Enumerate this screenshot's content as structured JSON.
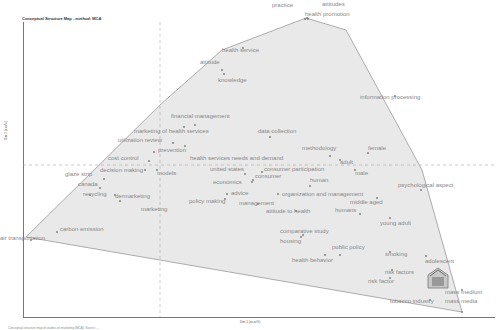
{
  "chart_data": {
    "type": "scatter",
    "title": "Conceptual Structure Map - method: MCA",
    "xlabel": "Dim 1 (xx.xx%)",
    "ylabel": "Dim 2 (x.xx%)",
    "grid": false,
    "reference_lines": {
      "x_zero": 160,
      "y_zero": 165
    },
    "hull_color": "#e8e8e8",
    "hull_stroke": "#999999",
    "hull": [
      [
        26,
        237
      ],
      [
        160,
        105
      ],
      [
        222,
        50
      ],
      [
        306,
        18
      ],
      [
        346,
        30
      ],
      [
        422,
        170
      ],
      [
        462,
        312
      ],
      [
        26,
        237
      ]
    ],
    "points": [
      {
        "label": "practice",
        "x": 305,
        "y": 19,
        "lx": 272,
        "ly": 7
      },
      {
        "label": "attitudes",
        "x": 307,
        "y": 18,
        "lx": 322,
        "ly": 6
      },
      {
        "label": "health promotion",
        "x": 308,
        "y": 19,
        "lx": 305,
        "ly": 16
      },
      {
        "label": "health service",
        "x": 243,
        "y": 48,
        "lx": 222,
        "ly": 52
      },
      {
        "label": "attitude",
        "x": 222,
        "y": 70,
        "lx": 200,
        "ly": 64
      },
      {
        "label": "knowledge",
        "x": 224,
        "y": 74,
        "lx": 218,
        "ly": 82
      },
      {
        "label": "information processing",
        "x": 395,
        "y": 96,
        "lx": 360,
        "ly": 99
      },
      {
        "label": "financial management",
        "x": 195,
        "y": 125,
        "lx": 171,
        "ly": 118
      },
      {
        "label": "marketing of health services",
        "x": 184,
        "y": 127,
        "lx": 134,
        "ly": 133
      },
      {
        "label": "data collection",
        "x": 270,
        "y": 137,
        "lx": 258,
        "ly": 133
      },
      {
        "label": "utilization review",
        "x": 173,
        "y": 143,
        "lx": 118,
        "ly": 142
      },
      {
        "label": "prevention",
        "x": 154,
        "y": 152,
        "lx": 158,
        "ly": 152
      },
      {
        "label": "health services needs and demand",
        "x": 185,
        "y": 146,
        "lx": 190,
        "ly": 160
      },
      {
        "label": "methodology",
        "x": 330,
        "y": 156,
        "lx": 302,
        "ly": 150
      },
      {
        "label": "female",
        "x": 368,
        "y": 153,
        "lx": 368,
        "ly": 150
      },
      {
        "label": "adult",
        "x": 340,
        "y": 160,
        "lx": 340,
        "ly": 164
      },
      {
        "label": "male",
        "x": 355,
        "y": 170,
        "lx": 355,
        "ly": 175
      },
      {
        "label": "cost control",
        "x": 149,
        "y": 161,
        "lx": 108,
        "ly": 160
      },
      {
        "label": "decision making",
        "x": 145,
        "y": 170,
        "lx": 100,
        "ly": 172
      },
      {
        "label": "models",
        "x": 157,
        "y": 170,
        "lx": 157,
        "ly": 175
      },
      {
        "label": "united states",
        "x": 245,
        "y": 174,
        "lx": 210,
        "ly": 171
      },
      {
        "label": "consumer participation",
        "x": 262,
        "y": 172,
        "lx": 264,
        "ly": 171
      },
      {
        "label": "consumer",
        "x": 253,
        "y": 180,
        "lx": 255,
        "ly": 178
      },
      {
        "label": "economics",
        "x": 252,
        "y": 182,
        "lx": 213,
        "ly": 184
      },
      {
        "label": "human",
        "x": 310,
        "y": 186,
        "lx": 310,
        "ly": 182
      },
      {
        "label": "glaze strip",
        "x": 104,
        "y": 179,
        "lx": 65,
        "ly": 176
      },
      {
        "label": "canada",
        "x": 100,
        "y": 188,
        "lx": 78,
        "ly": 186
      },
      {
        "label": "psychological aspect",
        "x": 421,
        "y": 190,
        "lx": 398,
        "ly": 187
      },
      {
        "label": "advice",
        "x": 227,
        "y": 194,
        "lx": 231,
        "ly": 195
      },
      {
        "label": "organization and management",
        "x": 278,
        "y": 194,
        "lx": 282,
        "ly": 196
      },
      {
        "label": "recycling",
        "x": 90,
        "y": 195,
        "lx": 83,
        "ly": 196
      },
      {
        "label": "dermarketing",
        "x": 115,
        "y": 195,
        "lx": 115,
        "ly": 198
      },
      {
        "label": "middle aged",
        "x": 377,
        "y": 198,
        "lx": 350,
        "ly": 204
      },
      {
        "label": "policy making",
        "x": 225,
        "y": 199,
        "lx": 189,
        "ly": 203
      },
      {
        "label": "management",
        "x": 258,
        "y": 204,
        "lx": 239,
        "ly": 205
      },
      {
        "label": "marketing",
        "x": 120,
        "y": 201,
        "lx": 141,
        "ly": 211
      },
      {
        "label": "attitude to health",
        "x": 296,
        "y": 211,
        "lx": 266,
        "ly": 213
      },
      {
        "label": "humans",
        "x": 360,
        "y": 214,
        "lx": 335,
        "ly": 212
      },
      {
        "label": "young adult",
        "x": 390,
        "y": 218,
        "lx": 380,
        "ly": 225
      },
      {
        "label": "comparative study",
        "x": 303,
        "y": 235,
        "lx": 280,
        "ly": 233
      },
      {
        "label": "housing",
        "x": 301,
        "y": 237,
        "lx": 280,
        "ly": 243
      },
      {
        "label": "carbon emission",
        "x": 57,
        "y": 232,
        "lx": 60,
        "ly": 231
      },
      {
        "label": "air transportation",
        "x": 31,
        "y": 240,
        "lx": 0,
        "ly": 240
      },
      {
        "label": "public policy",
        "x": 340,
        "y": 255,
        "lx": 332,
        "ly": 249
      },
      {
        "label": "health behavior",
        "x": 325,
        "y": 255,
        "lx": 292,
        "ly": 262
      },
      {
        "label": "smoking",
        "x": 390,
        "y": 252,
        "lx": 385,
        "ly": 256
      },
      {
        "label": "adolescent",
        "x": 426,
        "y": 256,
        "lx": 425,
        "ly": 263
      },
      {
        "label": "risk factors",
        "x": 392,
        "y": 270,
        "lx": 385,
        "ly": 274
      },
      {
        "label": "risk factor",
        "x": 390,
        "y": 278,
        "lx": 368,
        "ly": 283
      },
      {
        "label": "mass medium",
        "x": 462,
        "y": 290,
        "lx": 445,
        "ly": 294
      },
      {
        "label": "tobacco industry",
        "x": 430,
        "y": 300,
        "lx": 390,
        "ly": 303
      },
      {
        "label": "mass media",
        "x": 462,
        "y": 312,
        "lx": 445,
        "ly": 303
      }
    ]
  },
  "caption": "Conceptual structure map of studies on marketing (MCA). Source: ...",
  "axes": {
    "xlabel": "Dim 1 (xx.xx%)",
    "ylabel": "Dim 2 (x.xx%)"
  },
  "title": "Conceptual Structure Map - method: MCA"
}
